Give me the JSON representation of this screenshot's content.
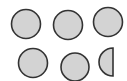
{
  "canvas": {
    "width": 127,
    "height": 81,
    "background": "#ffffff"
  },
  "style": {
    "fill": "#d3d3d3",
    "stroke": "#333333",
    "stroke_width": 1.6
  },
  "shapes": [
    {
      "type": "circle",
      "cx": 26,
      "cy": 24,
      "r": 14.5
    },
    {
      "type": "circle",
      "cx": 68,
      "cy": 25,
      "r": 14.5
    },
    {
      "type": "circle",
      "cx": 108,
      "cy": 22,
      "r": 14.5
    },
    {
      "type": "circle",
      "cx": 33,
      "cy": 63,
      "r": 14.5
    },
    {
      "type": "circle",
      "cx": 75,
      "cy": 67,
      "r": 14
    },
    {
      "type": "half-circle",
      "cx": 113,
      "cy": 62,
      "r": 14,
      "side": "left"
    }
  ]
}
